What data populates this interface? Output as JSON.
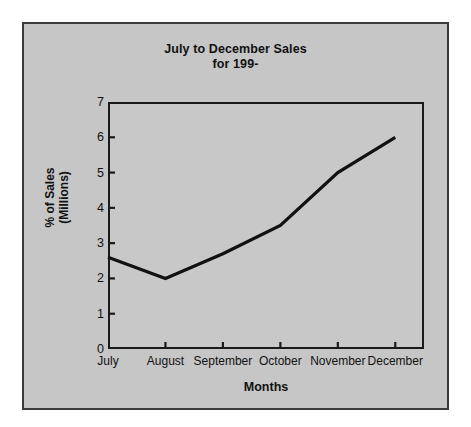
{
  "chart_data": {
    "type": "line",
    "title": "July to December Sales for 199-",
    "title_lines": [
      "July to December Sales",
      "for 199-"
    ],
    "xlabel": "Months",
    "ylabel": "% of Sales (Millions)",
    "ylabel_lines": [
      "% of Sales",
      "(Millions)"
    ],
    "categories": [
      "July",
      "August",
      "September",
      "October",
      "November",
      "December"
    ],
    "values": [
      2.6,
      2.0,
      2.7,
      3.5,
      5.0,
      6.0
    ],
    "series": [
      {
        "name": "% of Sales (Millions)",
        "values": [
          2.6,
          2.0,
          2.7,
          3.5,
          5.0,
          6.0
        ]
      }
    ],
    "ylim": [
      0,
      7
    ],
    "y_ticks": [
      0,
      1,
      2,
      3,
      4,
      5,
      6,
      7
    ],
    "y_tick_labels": [
      "0",
      "1",
      "2",
      "3",
      "4",
      "5",
      "6",
      "7"
    ],
    "grid": false,
    "legend": false,
    "line_color": "#111111",
    "line_width": 3.2,
    "plot_background": "#c8c8c8",
    "figure_background": "#c6c6c6",
    "frame_color": "#1a1a1a"
  }
}
